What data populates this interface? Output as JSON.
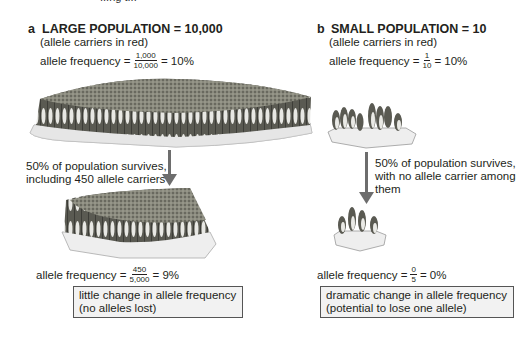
{
  "top_fragment": "...ng t...",
  "panel_a": {
    "letter": "a",
    "title": "LARGE POPULATION = 10,000",
    "subtitle": "(allele carriers in red)",
    "initial_frequency": {
      "label": "allele frequency =",
      "numerator": "1,000",
      "denominator": "10,000",
      "result": "= 10%"
    },
    "survival_note_line1": "50% of population survives,",
    "survival_note_line2": "including 450 allele carriers",
    "final_frequency": {
      "label": "allele frequency =",
      "numerator": "450",
      "denominator": "5,000",
      "result": "= 9%"
    },
    "conclusion_line1": "little change in allele frequency",
    "conclusion_line2": "(no alleles lost)",
    "icons": {
      "large_colony": "penguin-colony-large-illustration",
      "surviving_colony": "penguin-colony-half-illustration",
      "arrow": "arrow-down"
    }
  },
  "panel_b": {
    "letter": "b",
    "title": "SMALL POPULATION = 10",
    "subtitle": "(allele carriers in red)",
    "initial_frequency": {
      "label": "allele frequency =",
      "numerator": "1",
      "denominator": "10",
      "result": "= 10%"
    },
    "survival_note_line1": "50% of population survives,",
    "survival_note_line2": "with no allele carrier among",
    "survival_note_line3": "them",
    "final_frequency": {
      "label": "allele frequency =",
      "numerator": "0",
      "denominator": "5",
      "result": "= 0%"
    },
    "conclusion_line1": "dramatic change in allele frequency",
    "conclusion_line2": "(potential to lose one allele)",
    "icons": {
      "small_colony": "penguin-group-small-illustration",
      "surviving_group": "penguin-group-tiny-illustration",
      "arrow": "arrow-down"
    }
  },
  "colors": {
    "text": "#231f20",
    "arrow": "#6d6d6d",
    "ice": "#eeeeee",
    "colony_top": "#7a7a6e",
    "box_border": "#555555",
    "box_fill": "#f2f2f2"
  }
}
